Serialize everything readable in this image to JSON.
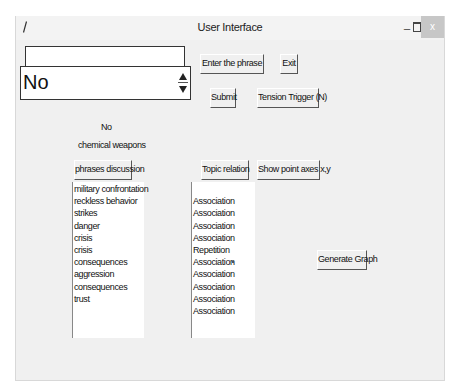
{
  "window": {
    "title": "User Interface",
    "controls": {
      "minimize": "_",
      "maximize": "□",
      "close": "x"
    }
  },
  "entry": {
    "value": "",
    "placeholder": ""
  },
  "spinbox": {
    "value": "No"
  },
  "buttons": {
    "enter_phrase": "Enter the phrase",
    "exit": "Exit",
    "submit": "Submit",
    "tension_trigger": "Tension Trigger (N)",
    "phrases_discussion": "phrases discussion",
    "topic_relation": "Topic relation",
    "show_point_axes": "Show point axes x,y",
    "generate_graph": "Generate Graph"
  },
  "labels": {
    "answer": "No",
    "topic": "chemical weapons"
  },
  "phrases_list": [
    "military confrontation",
    "reckless behavior",
    "strikes",
    "danger",
    "crisis",
    "crisis",
    "consequences",
    "aggression",
    "consequences",
    "trust"
  ],
  "relations_list": [
    "",
    "Association",
    "Association",
    "Association",
    "Association",
    "Repetition",
    "Association",
    "Association",
    "Association",
    "Association",
    "Association"
  ]
}
